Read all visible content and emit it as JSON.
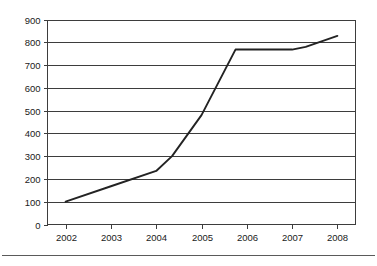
{
  "chart_data": {
    "type": "line",
    "title": "",
    "subtitle": "",
    "xlabel": "",
    "ylabel": "",
    "x": [
      2002,
      2003,
      2004,
      2005,
      2006,
      2007,
      2008
    ],
    "xtick_labels": [
      "2002",
      "2003",
      "2004",
      "2005",
      "2006",
      "2007",
      "2008"
    ],
    "ytick_labels": [
      "0",
      "100",
      "200",
      "300",
      "400",
      "500",
      "600",
      "700",
      "800",
      "900"
    ],
    "ytick_values": [
      0,
      100,
      200,
      300,
      400,
      500,
      600,
      700,
      800,
      900
    ],
    "xlim": [
      2001.6,
      2008.4
    ],
    "ylim": [
      0,
      900
    ],
    "grid": "horizontal",
    "legend": "none",
    "series": [
      {
        "name": "series-1",
        "color": "#232323",
        "points": [
          {
            "x": 2002.0,
            "y": 100
          },
          {
            "x": 2003.0,
            "y": 168
          },
          {
            "x": 2004.0,
            "y": 235
          },
          {
            "x": 2004.35,
            "y": 300
          },
          {
            "x": 2005.0,
            "y": 480
          },
          {
            "x": 2005.75,
            "y": 768
          },
          {
            "x": 2006.0,
            "y": 768
          },
          {
            "x": 2007.0,
            "y": 768
          },
          {
            "x": 2007.3,
            "y": 780
          },
          {
            "x": 2008.0,
            "y": 828
          }
        ]
      }
    ]
  },
  "axes": {
    "y_axis_name": "value-axis",
    "x_axis_name": "year-axis"
  }
}
